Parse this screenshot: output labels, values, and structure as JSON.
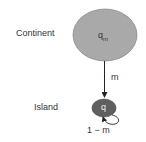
{
  "diagram": {
    "continent": {
      "label": "Continent",
      "node_text": "q",
      "node_sub": "m",
      "fill": "#a9a9a9"
    },
    "island": {
      "label": "Island",
      "node_text": "q",
      "fill": "#5f5f5f"
    },
    "migration_edge": {
      "label": "m"
    },
    "self_loop": {
      "label": "1 − m"
    }
  }
}
